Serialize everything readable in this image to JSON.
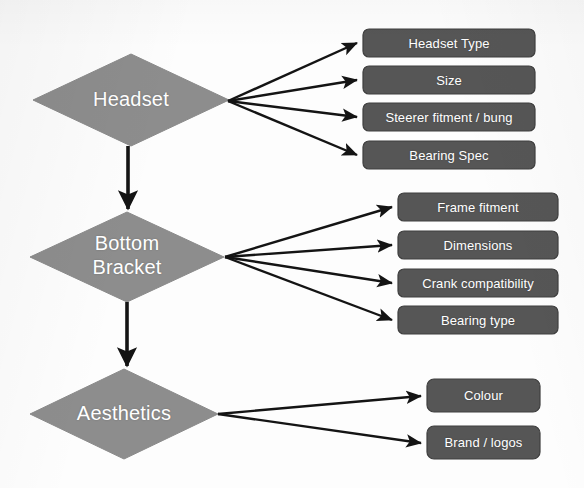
{
  "diagram": {
    "colors": {
      "background": "#fdfdfd",
      "diamond_fill": "#8d8d8d",
      "box_fill": "#565656",
      "box_stroke": "#3f3f3f",
      "connector": "#141414",
      "label_text": "#ffffff"
    },
    "nodes": [
      {
        "id": "headset",
        "shape": "diamond",
        "label": "Headset",
        "lines": [
          "Headset"
        ],
        "cx": 131,
        "cy": 100,
        "rx": 98,
        "ry": 46
      },
      {
        "id": "bottom-bracket",
        "shape": "diamond",
        "label": "Bottom Bracket",
        "lines": [
          "Bottom",
          "Bracket"
        ],
        "cx": 127,
        "cy": 257,
        "rx": 97,
        "ry": 45
      },
      {
        "id": "aesthetics",
        "shape": "diamond",
        "label": "Aesthetics",
        "lines": [
          "Aesthetics"
        ],
        "cx": 124,
        "cy": 414,
        "rx": 94,
        "ry": 45
      }
    ],
    "groups": [
      {
        "id": "headset-attributes",
        "parent": "headset",
        "origin": {
          "x": 228,
          "y": 101
        },
        "boxes": [
          {
            "id": "headset-type",
            "label": "Headset Type",
            "x": 363,
            "y": 29,
            "w": 172,
            "h": 28
          },
          {
            "id": "size",
            "label": "Size",
            "x": 363,
            "y": 66,
            "w": 172,
            "h": 28
          },
          {
            "id": "steerer-fitment-bung",
            "label": "Steerer fitment / bung",
            "x": 363,
            "y": 103,
            "w": 172,
            "h": 28
          },
          {
            "id": "bearing-spec",
            "label": "Bearing Spec",
            "x": 363,
            "y": 141,
            "w": 172,
            "h": 28
          }
        ]
      },
      {
        "id": "bottom-bracket-attributes",
        "parent": "bottom-bracket",
        "origin": {
          "x": 225,
          "y": 257
        },
        "boxes": [
          {
            "id": "frame-fitment",
            "label": "Frame fitment",
            "x": 398,
            "y": 193,
            "w": 160,
            "h": 28
          },
          {
            "id": "dimensions",
            "label": "Dimensions",
            "x": 398,
            "y": 231,
            "w": 160,
            "h": 28
          },
          {
            "id": "crank-compatibility",
            "label": "Crank compatibility",
            "x": 398,
            "y": 269,
            "w": 160,
            "h": 28
          },
          {
            "id": "bearing-type",
            "label": "Bearing type",
            "x": 398,
            "y": 306,
            "w": 160,
            "h": 28
          }
        ]
      },
      {
        "id": "aesthetics-attributes",
        "parent": "aesthetics",
        "origin": {
          "x": 218,
          "y": 414
        },
        "boxes": [
          {
            "id": "colour",
            "label": "Colour",
            "x": 427,
            "y": 379,
            "w": 113,
            "h": 33
          },
          {
            "id": "brand-logos",
            "label": "Brand / logos",
            "x": 427,
            "y": 426,
            "w": 113,
            "h": 33
          }
        ]
      }
    ],
    "flow_connectors": [
      {
        "id": "headset-to-bottom-bracket",
        "from": "headset",
        "to": "bottom-bracket",
        "x": 128,
        "y1": 146,
        "y2": 211
      },
      {
        "id": "bottom-bracket-to-aesthetics",
        "from": "bottom-bracket",
        "to": "aesthetics",
        "x": 127,
        "y1": 302,
        "y2": 368
      }
    ]
  }
}
